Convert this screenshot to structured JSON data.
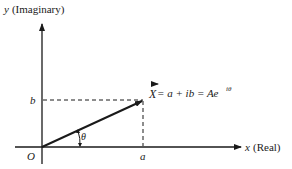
{
  "diagram": {
    "type": "complex-plane-phasor",
    "y_axis_label": "y (Imaginary)",
    "y_axis_var": "y",
    "y_axis_name": "(Imaginary)",
    "x_axis_var": "x",
    "x_axis_name": "(Real)",
    "origin_label": "O",
    "real_part_label": "a",
    "imag_part_label": "b",
    "angle_label": "θ",
    "vector_label": "X",
    "equation_rest": " = a + ib = Ae",
    "exponent": "iθ",
    "colors": {
      "stroke": "#1a1a1a",
      "background": "#ffffff"
    }
  }
}
